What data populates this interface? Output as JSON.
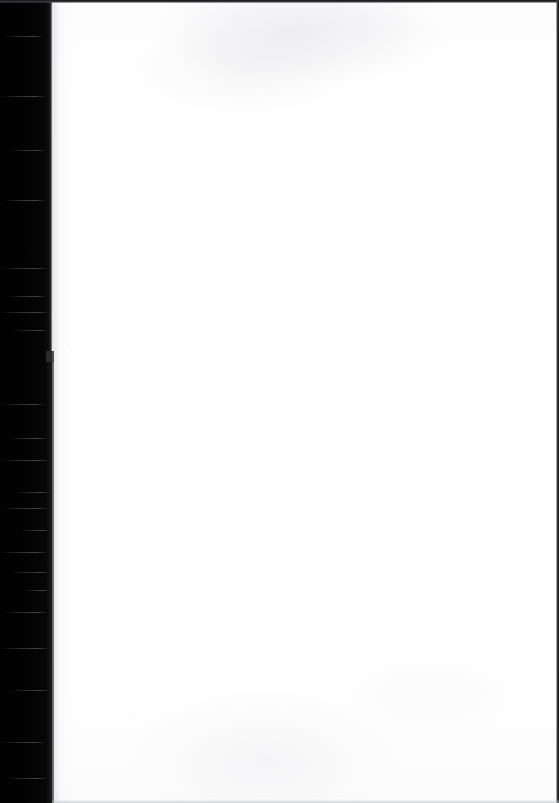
{
  "document": {
    "kind": "scanned-page-image",
    "page_content": "",
    "page_note": "blank page"
  },
  "scan": {
    "width_px": 559,
    "height_px": 803,
    "page_body_text": "",
    "gutter": {
      "name": "binding-gutter-shadow",
      "side": "left",
      "width_px": 52,
      "width_px_lower": 54,
      "color": "#010101"
    },
    "page": {
      "name": "paper-area",
      "left_px": 52,
      "width_px": 507,
      "color": "#ffffff"
    },
    "edges": {
      "top_line_color": "#141416",
      "right_line_color": "#121214",
      "bottom_line_color": "#acaeb4"
    },
    "artifacts": {
      "top_smudge": "faint gray scanner smudge",
      "bottom_smudge": "faint gray scanner smudge",
      "gutter_streaks": "horizontal light streaks",
      "edge_notch": "small notch in gutter edge"
    },
    "streak_rows": [
      {
        "top": 36,
        "left": 4,
        "width": 40
      },
      {
        "top": 96,
        "left": 0,
        "width": 46
      },
      {
        "top": 150,
        "left": 10,
        "width": 36
      },
      {
        "top": 200,
        "left": 2,
        "width": 44
      },
      {
        "top": 268,
        "left": 0,
        "width": 48
      },
      {
        "top": 296,
        "left": 6,
        "width": 40
      },
      {
        "top": 312,
        "left": 0,
        "width": 50
      },
      {
        "top": 330,
        "left": 14,
        "width": 34
      },
      {
        "top": 404,
        "left": 0,
        "width": 46
      },
      {
        "top": 438,
        "left": 8,
        "width": 40
      },
      {
        "top": 460,
        "left": 0,
        "width": 50
      },
      {
        "top": 492,
        "left": 16,
        "width": 34
      },
      {
        "top": 508,
        "left": 2,
        "width": 46
      },
      {
        "top": 530,
        "left": 20,
        "width": 30
      },
      {
        "top": 552,
        "left": 0,
        "width": 48
      },
      {
        "top": 572,
        "left": 12,
        "width": 38
      },
      {
        "top": 590,
        "left": 24,
        "width": 26
      },
      {
        "top": 612,
        "left": 4,
        "width": 44
      },
      {
        "top": 648,
        "left": 0,
        "width": 50
      },
      {
        "top": 690,
        "left": 10,
        "width": 40
      },
      {
        "top": 742,
        "left": 0,
        "width": 46
      },
      {
        "top": 778,
        "left": 6,
        "width": 42
      }
    ]
  }
}
